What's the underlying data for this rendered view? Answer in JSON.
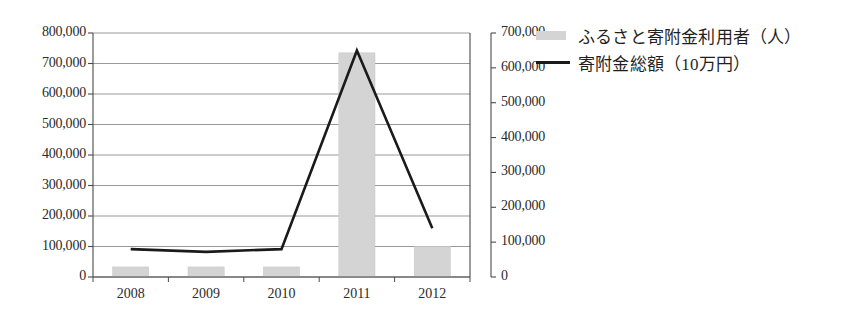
{
  "chart_data": {
    "type": "bar",
    "title": "",
    "xlabel": "",
    "categories": [
      "2008",
      "2009",
      "2010",
      "2011",
      "2012"
    ],
    "grid": true,
    "legend_position": "right",
    "series": [
      {
        "name": "ふるさと寄附金利用者（人）",
        "type": "bar",
        "axis": "left",
        "color": "#d4d4d4",
        "values": [
          33000,
          33000,
          33000,
          735000,
          100000
        ]
      },
      {
        "name": "寄附金総額（10万円）",
        "type": "line",
        "axis": "right",
        "color": "#1a1a1a",
        "values": [
          80000,
          72000,
          80000,
          650000,
          140000
        ]
      }
    ],
    "axes": {
      "left": {
        "label": "",
        "ylim": [
          0,
          800000
        ],
        "tick_step": 100000,
        "ticks": [
          "0",
          "100,000",
          "200,000",
          "300,000",
          "400,000",
          "500,000",
          "600,000",
          "700,000",
          "800,000"
        ]
      },
      "right": {
        "label": "",
        "ylim": [
          0,
          700000
        ],
        "tick_step": 100000,
        "ticks": [
          "0",
          "100,000",
          "200,000",
          "300,000",
          "400,000",
          "500,000",
          "600,000",
          "700,000"
        ]
      }
    }
  },
  "legend": {
    "items": [
      {
        "label": "ふるさと寄附金利用者（人）",
        "marker": "bar-swatch-icon",
        "color": "#d4d4d4"
      },
      {
        "label": "寄附金総額（10万円）",
        "marker": "line-swatch-icon",
        "color": "#1a1a1a"
      }
    ]
  }
}
